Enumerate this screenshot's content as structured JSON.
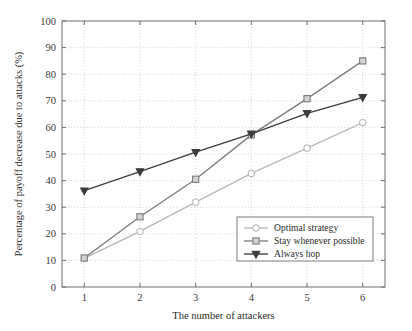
{
  "chart_data": {
    "type": "line",
    "title": "",
    "xlabel": "The number of attackers",
    "ylabel": "Percentage of payoff decrease due to attacks (%)",
    "x": [
      1,
      2,
      3,
      4,
      5,
      6
    ],
    "xlim": [
      0.6,
      6.4
    ],
    "ylim": [
      0,
      100
    ],
    "xticks": [
      "1",
      "2",
      "3",
      "4",
      "5",
      "6"
    ],
    "yticks": [
      "0",
      "10",
      "20",
      "30",
      "40",
      "50",
      "60",
      "70",
      "80",
      "90",
      "100"
    ],
    "grid": true,
    "legend_position": "lower right",
    "series": [
      {
        "name": "Optimal strategy",
        "marker": "circle",
        "color": "#b9b9b9",
        "values": [
          10.8,
          20.9,
          31.9,
          42.7,
          52.2,
          61.8
        ]
      },
      {
        "name": "Stay whenever possible",
        "marker": "square",
        "color": "#7d7d7d",
        "values": [
          10.9,
          26.4,
          40.5,
          57.2,
          70.8,
          85.0
        ]
      },
      {
        "name": "Always hop",
        "marker": "triangle-down",
        "color": "#3c3c3c",
        "values": [
          36.2,
          43.4,
          50.7,
          57.6,
          65.3,
          71.3
        ]
      }
    ]
  },
  "axes": {
    "frame_color": "#6e6e6e",
    "grid_color": "#c8c8c8"
  }
}
